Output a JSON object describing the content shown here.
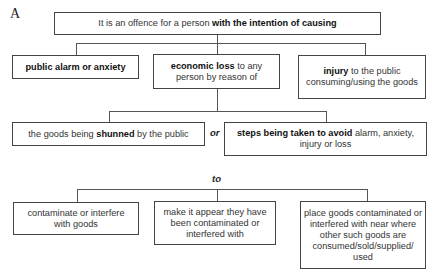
{
  "figure_label": "A",
  "root": {
    "pre": "It is an offence for a person ",
    "bold": "with the intention of causing",
    "post": ""
  },
  "level1": [
    {
      "bold": "public alarm or anxiety",
      "post": ""
    },
    {
      "bold": "economic loss",
      "post": " to any person by reason of"
    },
    {
      "bold": "injury",
      "post": " to the public consuming/using the goods"
    }
  ],
  "level2": [
    {
      "pre": "the goods being ",
      "bold": "shunned",
      "post": " by the public"
    },
    {
      "pre": "",
      "bold": "steps being taken to avoid",
      "post": " alarm, anxiety, injury or loss"
    }
  ],
  "connector_or": "or",
  "connector_to": "to",
  "level3": [
    {
      "text": "contaminate or interfere with goods"
    },
    {
      "text": "make it appear they have been contaminated or interfered with"
    },
    {
      "text": "place goods contaminated or interfered with near where other such goods are consumed/sold/supplied/ used"
    }
  ]
}
